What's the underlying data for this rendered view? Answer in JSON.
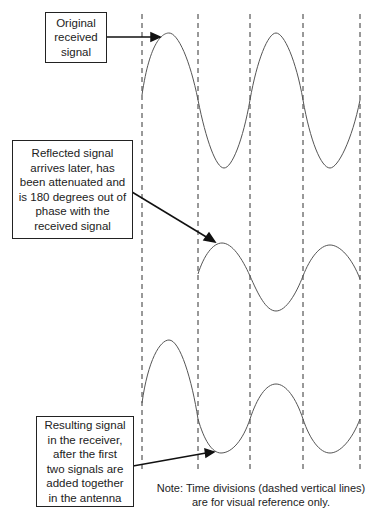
{
  "labels": {
    "original": [
      "Original",
      "received",
      "signal"
    ],
    "reflected": [
      "Reflected signal",
      "arrives later, has",
      "been attenuated and",
      "is 180 degrees out of",
      "phase with the",
      "received signal"
    ],
    "resulting": [
      "Resulting signal",
      "in the receiver,",
      "after the first",
      "two signals are",
      "added together",
      "in the antenna"
    ]
  },
  "note": [
    "Note: Time divisions (dashed vertical lines)",
    "are for visual reference only."
  ],
  "signals": [
    {
      "name": "Original received signal",
      "amplitude": "full",
      "phase_deg": 0
    },
    {
      "name": "Reflected signal",
      "amplitude": "attenuated (~half)",
      "phase_deg": 180,
      "delay": "one time division"
    },
    {
      "name": "Resulting signal",
      "amplitude": "full then reduced",
      "description": "sum of original and reflected"
    }
  ],
  "time_divisions": 5
}
